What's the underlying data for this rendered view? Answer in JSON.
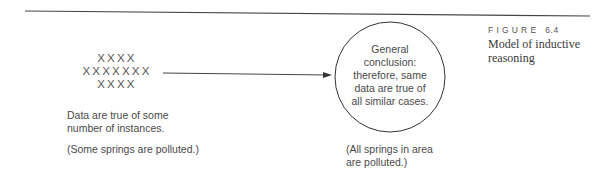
{
  "figure": {
    "label": "FIGURE",
    "number": "6.4",
    "caption": "Model of inductive reasoning"
  },
  "premise": {
    "x_rows": [
      "XXXX",
      "XXXXXXX",
      "XXXX"
    ],
    "description": "Data are true of some number of instances.",
    "example": "(Some springs are polluted.)"
  },
  "conclusion": {
    "circle_lines": [
      "General",
      "conclusion:",
      "therefore, same",
      "data are true of",
      "all similar cases."
    ],
    "example": "(All springs in area are polluted.)"
  },
  "colors": {
    "line": "#3a3a3a",
    "text": "#4a4a4a",
    "background": "#ffffff"
  }
}
